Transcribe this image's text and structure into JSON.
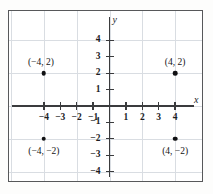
{
  "figure": {
    "background_color": "#ffffff",
    "border_color": "#57585a",
    "grid_color": "#d9dde2",
    "axis_color": "#3a3b3d",
    "point_color": "#111113"
  },
  "axes": {
    "x_name": "x",
    "y_name": "y",
    "x_ticks": [
      {
        "value": -4,
        "label": "−4"
      },
      {
        "value": -3,
        "label": "−3"
      },
      {
        "value": -2,
        "label": "−2"
      },
      {
        "value": -1,
        "label": "−1"
      },
      {
        "value": 1,
        "label": "1"
      },
      {
        "value": 2,
        "label": "2"
      },
      {
        "value": 3,
        "label": "3"
      },
      {
        "value": 4,
        "label": "4"
      }
    ],
    "y_ticks": [
      {
        "value": 4,
        "label": "4"
      },
      {
        "value": 3,
        "label": "3"
      },
      {
        "value": 2,
        "label": "2"
      },
      {
        "value": 1,
        "label": "1"
      },
      {
        "value": -1,
        "label": "−1"
      },
      {
        "value": -2,
        "label": "−2"
      },
      {
        "value": -3,
        "label": "−3"
      },
      {
        "value": -4,
        "label": "−4"
      }
    ]
  },
  "chart_data": {
    "type": "scatter",
    "title": "",
    "xlabel": "x",
    "ylabel": "y",
    "xlim": [
      -5,
      5
    ],
    "ylim": [
      -4.6,
      4.8
    ],
    "grid": true,
    "grid_spacing": 2,
    "legend": "none",
    "points": [
      {
        "x": -4,
        "y": 2,
        "label": "(−4, 2)",
        "label_position": "above-left"
      },
      {
        "x": 4,
        "y": 2,
        "label": "(4, 2)",
        "label_position": "above"
      },
      {
        "x": -4,
        "y": -2,
        "label": "(−4, −2)",
        "label_position": "below"
      },
      {
        "x": 4,
        "y": -2,
        "label": "(4, −2)",
        "label_position": "below"
      }
    ]
  }
}
